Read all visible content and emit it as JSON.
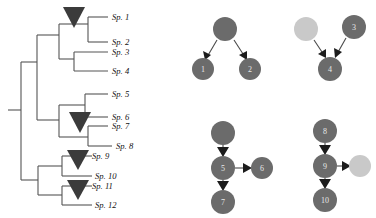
{
  "figure": {
    "colors": {
      "branch": "#555555",
      "marker_triangle": "#3b3b3b",
      "node_dark": "#6b6b6b",
      "node_light": "#c9c9c9",
      "node_label": "#e8e8e8",
      "arrow": "#1c1c1c",
      "background": "#ffffff"
    }
  },
  "tree": {
    "name": "phylogenetic-tree",
    "tips": [
      {
        "id": "tip-1",
        "label": "Sp. 1",
        "y": 17
      },
      {
        "id": "tip-2",
        "label": "Sp. 2",
        "y": 42
      },
      {
        "id": "tip-3",
        "label": "Sp. 3",
        "y": 52
      },
      {
        "id": "tip-4",
        "label": "Sp. 4",
        "y": 71
      },
      {
        "id": "tip-5",
        "label": "Sp. 5",
        "y": 94
      },
      {
        "id": "tip-6",
        "label": "Sp. 6",
        "y": 117
      },
      {
        "id": "tip-7",
        "label": "Sp. 7",
        "y": 126
      },
      {
        "id": "tip-8",
        "label": "Sp. 8",
        "y": 146
      },
      {
        "id": "tip-9",
        "label": "Sp. 9",
        "y": 156
      },
      {
        "id": "tip-10",
        "label": "Sp. 10",
        "y": 176
      },
      {
        "id": "tip-11",
        "label": "Sp. 11",
        "y": 186
      },
      {
        "id": "tip-12",
        "label": "Sp. 12",
        "y": 205
      }
    ],
    "markers": [
      {
        "id": "marker-clade-a",
        "cx": 74,
        "cy": 14
      },
      {
        "id": "marker-clade-b",
        "cx": 80,
        "cy": 120
      },
      {
        "id": "marker-clade-c",
        "cx": 78,
        "cy": 158
      },
      {
        "id": "marker-clade-d",
        "cx": 78,
        "cy": 188
      }
    ]
  },
  "networks": [
    {
      "id": "network-top-left",
      "name": "network-1",
      "nodes": [
        {
          "id": "n-root-1",
          "label": "",
          "cx": 225,
          "cy": 29,
          "r": 12,
          "shade": "dark"
        },
        {
          "id": "n-1",
          "label": "1",
          "cx": 203,
          "cy": 69,
          "r": 11,
          "shade": "dark"
        },
        {
          "id": "n-2",
          "label": "2",
          "cx": 250,
          "cy": 69,
          "r": 11,
          "shade": "dark"
        }
      ],
      "edges": [
        {
          "from": "n-root-1",
          "to": "n-1"
        },
        {
          "from": "n-root-1",
          "to": "n-2"
        }
      ]
    },
    {
      "id": "network-top-right",
      "name": "network-2",
      "nodes": [
        {
          "id": "n-light-1",
          "label": "",
          "cx": 306,
          "cy": 29,
          "r": 12,
          "shade": "light"
        },
        {
          "id": "n-3",
          "label": "3",
          "cx": 354,
          "cy": 27,
          "r": 12,
          "shade": "dark"
        },
        {
          "id": "n-4",
          "label": "4",
          "cx": 330,
          "cy": 69,
          "r": 12,
          "shade": "dark"
        }
      ],
      "edges": [
        {
          "from": "n-light-1",
          "to": "n-4"
        },
        {
          "from": "n-3",
          "to": "n-4"
        }
      ]
    },
    {
      "id": "network-bottom-left",
      "name": "network-3",
      "nodes": [
        {
          "id": "n-root-3",
          "label": "",
          "cx": 223,
          "cy": 133,
          "r": 12,
          "shade": "dark"
        },
        {
          "id": "n-5",
          "label": "5",
          "cx": 223,
          "cy": 168,
          "r": 12,
          "shade": "dark"
        },
        {
          "id": "n-6",
          "label": "6",
          "cx": 262,
          "cy": 168,
          "r": 11,
          "shade": "dark"
        },
        {
          "id": "n-7",
          "label": "7",
          "cx": 223,
          "cy": 202,
          "r": 12,
          "shade": "dark"
        }
      ],
      "edges": [
        {
          "from": "n-root-3",
          "to": "n-5"
        },
        {
          "from": "n-5",
          "to": "n-6"
        },
        {
          "from": "n-5",
          "to": "n-7"
        }
      ]
    },
    {
      "id": "network-bottom-right",
      "name": "network-4",
      "nodes": [
        {
          "id": "n-8",
          "label": "8",
          "cx": 325,
          "cy": 131,
          "r": 12,
          "shade": "dark"
        },
        {
          "id": "n-9",
          "label": "9",
          "cx": 325,
          "cy": 166,
          "r": 12,
          "shade": "dark"
        },
        {
          "id": "n-light-2",
          "label": "",
          "cx": 360,
          "cy": 166,
          "r": 11,
          "shade": "light"
        },
        {
          "id": "n-10",
          "label": "10",
          "cx": 325,
          "cy": 200,
          "r": 12,
          "shade": "dark"
        }
      ],
      "edges": [
        {
          "from": "n-8",
          "to": "n-9"
        },
        {
          "from": "n-9",
          "to": "n-light-2"
        },
        {
          "from": "n-9",
          "to": "n-10"
        }
      ]
    }
  ]
}
